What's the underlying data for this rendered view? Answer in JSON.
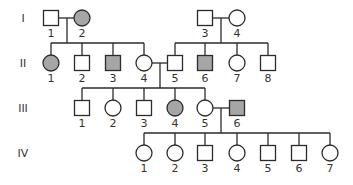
{
  "colors": {
    "affected": "#a6a6a6",
    "unaffected": "#ffffff",
    "stroke": "#2b2b2b"
  },
  "generations": [
    {
      "label": "I",
      "y": 18
    },
    {
      "label": "II",
      "y": 63
    },
    {
      "label": "III",
      "y": 108
    },
    {
      "label": "IV",
      "y": 153
    }
  ],
  "individuals": [
    {
      "id": "I-1",
      "gen": 0,
      "num": "1",
      "sex": "male",
      "affected": false,
      "x": 51
    },
    {
      "id": "I-2",
      "gen": 0,
      "num": "2",
      "sex": "female",
      "affected": true,
      "x": 82
    },
    {
      "id": "I-3",
      "gen": 0,
      "num": "3",
      "sex": "male",
      "affected": false,
      "x": 205
    },
    {
      "id": "I-4",
      "gen": 0,
      "num": "4",
      "sex": "female",
      "affected": false,
      "x": 237
    },
    {
      "id": "II-1",
      "gen": 1,
      "num": "1",
      "sex": "female",
      "affected": true,
      "x": 51
    },
    {
      "id": "II-2",
      "gen": 1,
      "num": "2",
      "sex": "male",
      "affected": false,
      "x": 82
    },
    {
      "id": "II-3",
      "gen": 1,
      "num": "3",
      "sex": "male",
      "affected": true,
      "x": 113
    },
    {
      "id": "II-4",
      "gen": 1,
      "num": "4",
      "sex": "female",
      "affected": false,
      "x": 144
    },
    {
      "id": "II-5",
      "gen": 1,
      "num": "5",
      "sex": "male",
      "affected": false,
      "x": 175
    },
    {
      "id": "II-6",
      "gen": 1,
      "num": "6",
      "sex": "male",
      "affected": true,
      "x": 205
    },
    {
      "id": "II-7",
      "gen": 1,
      "num": "7",
      "sex": "female",
      "affected": false,
      "x": 237
    },
    {
      "id": "II-8",
      "gen": 1,
      "num": "8",
      "sex": "male",
      "affected": false,
      "x": 268
    },
    {
      "id": "III-1",
      "gen": 2,
      "num": "1",
      "sex": "male",
      "affected": false,
      "x": 82
    },
    {
      "id": "III-2",
      "gen": 2,
      "num": "2",
      "sex": "female",
      "affected": false,
      "x": 113
    },
    {
      "id": "III-3",
      "gen": 2,
      "num": "3",
      "sex": "male",
      "affected": false,
      "x": 144
    },
    {
      "id": "III-4",
      "gen": 2,
      "num": "4",
      "sex": "female",
      "affected": true,
      "x": 175
    },
    {
      "id": "III-5",
      "gen": 2,
      "num": "5",
      "sex": "female",
      "affected": false,
      "x": 205
    },
    {
      "id": "III-6",
      "gen": 2,
      "num": "6",
      "sex": "male",
      "affected": true,
      "x": 237
    },
    {
      "id": "IV-1",
      "gen": 3,
      "num": "1",
      "sex": "female",
      "affected": false,
      "x": 144
    },
    {
      "id": "IV-2",
      "gen": 3,
      "num": "2",
      "sex": "female",
      "affected": false,
      "x": 175
    },
    {
      "id": "IV-3",
      "gen": 3,
      "num": "3",
      "sex": "male",
      "affected": false,
      "x": 205
    },
    {
      "id": "IV-4",
      "gen": 3,
      "num": "4",
      "sex": "female",
      "affected": false,
      "x": 237
    },
    {
      "id": "IV-5",
      "gen": 3,
      "num": "5",
      "sex": "male",
      "affected": false,
      "x": 268
    },
    {
      "id": "IV-6",
      "gen": 3,
      "num": "6",
      "sex": "male",
      "affected": false,
      "x": 299
    },
    {
      "id": "IV-7",
      "gen": 3,
      "num": "7",
      "sex": "female",
      "affected": false,
      "x": 330
    }
  ],
  "couples": [
    {
      "partners": [
        "I-1",
        "I-2"
      ],
      "dropX": 67,
      "children": [
        "II-1",
        "II-2",
        "II-3",
        "II-4"
      ]
    },
    {
      "partners": [
        "I-3",
        "I-4"
      ],
      "dropX": 221,
      "children": [
        "II-5",
        "II-6",
        "II-7",
        "II-8"
      ]
    },
    {
      "partners": [
        "II-4",
        "II-5"
      ],
      "dropX": 160,
      "children": [
        "III-1",
        "III-2",
        "III-3",
        "III-4",
        "III-5"
      ]
    },
    {
      "partners": [
        "III-5",
        "III-6"
      ],
      "dropX": 221,
      "children": [
        "IV-1",
        "IV-2",
        "IV-3",
        "IV-4",
        "IV-5",
        "IV-6",
        "IV-7"
      ]
    }
  ]
}
